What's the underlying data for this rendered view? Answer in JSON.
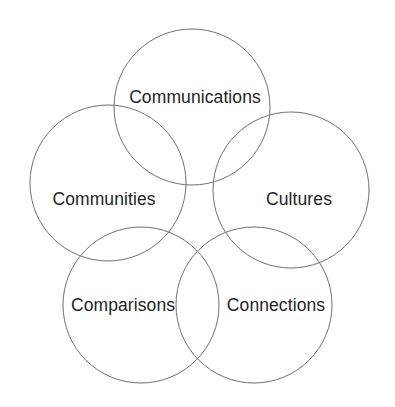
{
  "diagram": {
    "type": "venn-circles",
    "background_color": "#ffffff",
    "stroke_color": "#6f6f6f",
    "text_color": "#231f20",
    "stroke_width": 1,
    "circle_radius": 78,
    "circles": [
      {
        "id": "communications",
        "label": "Communications",
        "cx": 192,
        "cy": 107,
        "r": 78,
        "label_x": 195,
        "label_y": 98,
        "position": "top"
      },
      {
        "id": "communities",
        "label": "Communities",
        "cx": 108,
        "cy": 183,
        "r": 78,
        "label_x": 104,
        "label_y": 200,
        "position": "left"
      },
      {
        "id": "cultures",
        "label": "Cultures",
        "cx": 291,
        "cy": 190,
        "r": 78,
        "label_x": 299,
        "label_y": 200,
        "position": "right"
      },
      {
        "id": "comparisons",
        "label": "Comparisons",
        "cx": 141,
        "cy": 305,
        "r": 78,
        "label_x": 123,
        "label_y": 306,
        "position": "bottom-left"
      },
      {
        "id": "connections",
        "label": "Connections",
        "cx": 254,
        "cy": 305,
        "r": 78,
        "label_x": 276,
        "label_y": 306,
        "position": "bottom-right"
      }
    ]
  }
}
